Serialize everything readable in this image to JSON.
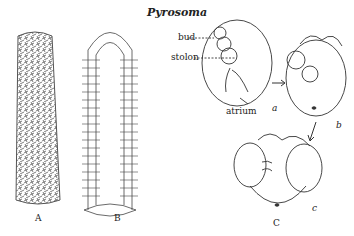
{
  "figure": {
    "title": "Pyrosoma",
    "panels": [
      {
        "id": "A",
        "label": "A"
      },
      {
        "id": "B",
        "label": "B"
      },
      {
        "id": "C",
        "label": "C"
      }
    ],
    "sub_labels": {
      "a": "a",
      "b": "b",
      "c": "c"
    },
    "annotations": {
      "bud": "bud",
      "stolon": "stolon",
      "atrium": "atrium"
    }
  }
}
